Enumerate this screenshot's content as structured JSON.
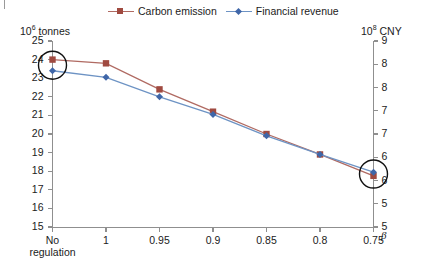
{
  "figure": {
    "left_axis_unit_label": "10⁶ tonnes",
    "right_axis_unit_label": "10⁸ CNY",
    "beta_symbol": "β"
  },
  "legend": {
    "entries": [
      {
        "label": "Carbon emission",
        "color": "#a04a40",
        "line_color": "#b06a62",
        "marker": "square"
      },
      {
        "label": "Financial revenue",
        "color": "#3f66a8",
        "line_color": "#6d93c4",
        "marker": "diamond"
      }
    ]
  },
  "chart_data": {
    "type": "line",
    "title": "",
    "xlabel": "β",
    "ylabel": "10⁶ tonnes",
    "y2label": "10⁸ CNY",
    "categories": [
      "No regulation",
      "1",
      "0.95",
      "0.9",
      "0.85",
      "0.8",
      "0.75"
    ],
    "x_tick_labels_multiline": [
      [
        "No",
        "regulation"
      ],
      [
        "1"
      ],
      [
        "0.95"
      ],
      [
        "0.9"
      ],
      [
        "0.85"
      ],
      [
        "0.8"
      ],
      [
        "0.75"
      ]
    ],
    "left_axis": {
      "ticks": [
        15,
        16,
        17,
        18,
        19,
        20,
        21,
        22,
        23,
        24,
        25
      ],
      "tick_labels": [
        "15",
        "16",
        "17",
        "18",
        "19",
        "20",
        "21",
        "22",
        "23",
        "24",
        "25"
      ],
      "ylim": [
        15,
        25
      ],
      "unit": "10⁶ tonnes"
    },
    "right_axis": {
      "ticks": [
        5,
        5.5,
        6,
        6.5,
        7,
        7.5,
        8,
        8.5,
        9
      ],
      "tick_labels": [
        "5",
        "5",
        "6",
        "6",
        "7",
        "7",
        "8",
        "8",
        "9"
      ],
      "ylim": [
        5,
        9
      ],
      "unit": "10⁸ CNY"
    },
    "grid": false,
    "legend_position": "top-center",
    "series": [
      {
        "name": "Carbon emission",
        "axis": "left",
        "unit": "10⁶ tonnes",
        "marker": "square",
        "color": "#a04a40",
        "line_color": "#b06a62",
        "values": [
          24.0,
          23.8,
          22.4,
          21.2,
          20.0,
          18.9,
          17.75
        ]
      },
      {
        "name": "Financial revenue",
        "axis": "right",
        "unit": "10⁸ CNY",
        "marker": "diamond",
        "color": "#3f66a8",
        "line_color": "#6d93c4",
        "values": [
          8.72,
          8.53,
          8.13,
          7.75,
          7.29,
          6.89,
          6.47
        ],
        "values_in_left_axis_units": [
          23.4,
          23.05,
          22.0,
          21.05,
          19.9,
          18.9,
          17.95
        ]
      }
    ],
    "annotations": [
      {
        "type": "circle",
        "target": "first-data-points",
        "category": "No regulation"
      },
      {
        "type": "circle",
        "target": "last-data-points",
        "category": "0.75"
      }
    ]
  }
}
